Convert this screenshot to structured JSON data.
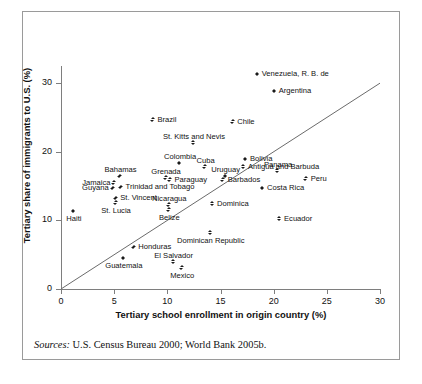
{
  "figure": {
    "label": "Figure",
    "number": "3.7",
    "title": "Education Profile of Native Population versus Migrants from Latin American and Caribbean Countries",
    "title_line1": "Education Profile of Native Population versus",
    "title_line2": "Migrants from Latin American and Caribbean Countries",
    "sources_label": "Sources:",
    "sources_text": "U.S. Census Bureau 2000; World Bank 2005b."
  },
  "chart_data": {
    "type": "scatter",
    "title": "Figure 3.7 Education Profile of Native Population versus Migrants from Latin American and Caribbean Countries",
    "xlabel": "Tertiary school enrollment in origin country (%)",
    "ylabel": "Tertiary share of immigrants to U.S. (%)",
    "xlim": [
      0,
      30
    ],
    "ylim": [
      0,
      32.5
    ],
    "xticks": [
      0,
      5,
      10,
      15,
      20,
      25,
      30
    ],
    "yticks": [
      0,
      10,
      20,
      30
    ],
    "grid": false,
    "legend": "none",
    "reference_line": {
      "type": "identity",
      "equation": "y = x",
      "from": [
        0,
        0
      ],
      "to": [
        30,
        30
      ]
    },
    "points": [
      {
        "name": "Venezuela, R. B. de",
        "x": 18.5,
        "y": 31.3,
        "label_pos": "right"
      },
      {
        "name": "Argentina",
        "x": 20.1,
        "y": 28.8,
        "label_pos": "right"
      },
      {
        "name": "Chile",
        "x": 16.2,
        "y": 24.4,
        "label_pos": "right"
      },
      {
        "name": "Brazil",
        "x": 8.7,
        "y": 24.7,
        "label_pos": "right"
      },
      {
        "name": "St. Kitts and Nevis",
        "x": 12.5,
        "y": 21.3,
        "label_pos": "above"
      },
      {
        "name": "Bolivia",
        "x": 17.4,
        "y": 18.9,
        "label_pos": "right"
      },
      {
        "name": "Antigua and Barbuda",
        "x": 17.2,
        "y": 17.8,
        "label_pos": "right"
      },
      {
        "name": "Panama",
        "x": 20.4,
        "y": 17.2,
        "label_pos": "above"
      },
      {
        "name": "Peru",
        "x": 23.1,
        "y": 16.1,
        "label_pos": "right"
      },
      {
        "name": "Colombia",
        "x": 11.2,
        "y": 18.3,
        "label_pos": "above"
      },
      {
        "name": "Cuba",
        "x": 13.6,
        "y": 17.8,
        "label_pos": "above"
      },
      {
        "name": "Uruguay",
        "x": 15.5,
        "y": 16.4,
        "label_pos": "above"
      },
      {
        "name": "Barbados",
        "x": 15.3,
        "y": 15.9,
        "label_pos": "right"
      },
      {
        "name": "Grenada",
        "x": 9.9,
        "y": 16.2,
        "label_pos": "above"
      },
      {
        "name": "Paraguay",
        "x": 10.3,
        "y": 15.9,
        "label_pos": "right"
      },
      {
        "name": "Bahamas",
        "x": 5.6,
        "y": 16.4,
        "label_pos": "above"
      },
      {
        "name": "Jamaica",
        "x": 5.0,
        "y": 15.5,
        "label_pos": "left"
      },
      {
        "name": "Guyana",
        "x": 4.9,
        "y": 14.7,
        "label_pos": "left"
      },
      {
        "name": "Trinidad and Tobago",
        "x": 5.7,
        "y": 14.8,
        "label_pos": "right"
      },
      {
        "name": "St. Vincent",
        "x": 5.2,
        "y": 13.2,
        "label_pos": "right"
      },
      {
        "name": "St. Lucia",
        "x": 5.2,
        "y": 12.6,
        "label_pos": "below"
      },
      {
        "name": "Nicaragua",
        "x": 10.2,
        "y": 12.3,
        "label_pos": "above"
      },
      {
        "name": "Belize",
        "x": 10.2,
        "y": 11.5,
        "label_pos": "below"
      },
      {
        "name": "Haiti",
        "x": 1.2,
        "y": 11.3,
        "label_pos": "below"
      },
      {
        "name": "Dominica",
        "x": 14.3,
        "y": 12.4,
        "label_pos": "right"
      },
      {
        "name": "Ecuador",
        "x": 20.6,
        "y": 10.2,
        "label_pos": "right"
      },
      {
        "name": "Costa Rica",
        "x": 19.0,
        "y": 14.7,
        "label_pos": "right"
      },
      {
        "name": "Dominican Republic",
        "x": 14.1,
        "y": 8.2,
        "label_pos": "below"
      },
      {
        "name": "Honduras",
        "x": 6.9,
        "y": 6.1,
        "label_pos": "right"
      },
      {
        "name": "Guatemala",
        "x": 5.9,
        "y": 4.5,
        "label_pos": "below"
      },
      {
        "name": "El Salvador",
        "x": 10.6,
        "y": 4.0,
        "label_pos": "above"
      },
      {
        "name": "Mexico",
        "x": 11.4,
        "y": 3.1,
        "label_pos": "below"
      }
    ]
  }
}
